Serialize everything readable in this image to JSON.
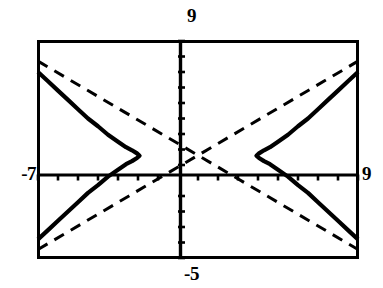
{
  "figure": {
    "name": "hyperbola-with-asymptotes-graph",
    "background_color": "#ffffff",
    "ink_color": "#000000"
  },
  "labels": {
    "ymax": "9",
    "ymin": "-5",
    "xmin": "-7",
    "xmax": "9"
  },
  "chart_data": {
    "type": "line",
    "title": "",
    "subtitle": "",
    "xlabel": "",
    "ylabel": "",
    "xlim": [
      -7,
      9
    ],
    "ylim": [
      -5,
      9
    ],
    "grid": false,
    "legend": "none",
    "axes": {
      "x_axis_at_y": 0,
      "y_axis_at_x": 0,
      "x_tick_interval": 1,
      "y_tick_interval": 1,
      "x_tick_labels_shown": [
        "-7",
        "9"
      ],
      "y_tick_labels_shown": [
        "9",
        "-5"
      ],
      "tick_length_px": 6,
      "frame": "rectangular window border"
    },
    "annotations": [
      "Window values: Xmin = -7, Xmax = 9, Ymin = -5, Ymax = 9",
      "Solid curve: horizontally opening hyperbola (two branches)",
      "Dashed lines: the two asymptotes of the hyperbola, crossing at the center"
    ],
    "hyperbola": {
      "center": [
        1,
        1.6
      ],
      "orientation": "horizontal",
      "a": 2.9,
      "b": 2.2,
      "left_vertex": [
        -1.9,
        1.6
      ],
      "right_vertex": [
        3.9,
        1.6
      ],
      "asymptote_slopes": [
        0.76,
        -0.76
      ]
    },
    "series": [
      {
        "name": "hyperbola-left-branch",
        "style": "solid",
        "points": [
          [
            -7.0,
            7.0
          ],
          [
            -6.5,
            6.4
          ],
          [
            -6.0,
            5.8
          ],
          [
            -5.5,
            5.2
          ],
          [
            -5.0,
            4.6
          ],
          [
            -4.5,
            4.0
          ],
          [
            -4.0,
            3.5
          ],
          [
            -3.5,
            2.95
          ],
          [
            -3.0,
            2.5
          ],
          [
            -2.6,
            2.15
          ],
          [
            -2.3,
            1.95
          ],
          [
            -2.05,
            1.75
          ],
          [
            -1.92,
            1.6
          ],
          [
            -2.05,
            1.45
          ],
          [
            -2.3,
            1.25
          ],
          [
            -2.6,
            1.05
          ],
          [
            -3.0,
            0.7
          ],
          [
            -3.5,
            0.25
          ],
          [
            -4.0,
            -0.3
          ],
          [
            -4.5,
            -0.8
          ],
          [
            -5.0,
            -1.4
          ],
          [
            -5.5,
            -2.0
          ],
          [
            -6.0,
            -2.6
          ],
          [
            -6.5,
            -3.2
          ],
          [
            -7.0,
            -3.8
          ]
        ]
      },
      {
        "name": "hyperbola-right-branch",
        "style": "solid",
        "points": [
          [
            9.0,
            7.0
          ],
          [
            8.5,
            6.4
          ],
          [
            8.0,
            5.8
          ],
          [
            7.5,
            5.2
          ],
          [
            7.0,
            4.6
          ],
          [
            6.5,
            4.0
          ],
          [
            6.0,
            3.5
          ],
          [
            5.5,
            2.95
          ],
          [
            5.0,
            2.5
          ],
          [
            4.6,
            2.15
          ],
          [
            4.3,
            1.95
          ],
          [
            4.05,
            1.75
          ],
          [
            3.92,
            1.6
          ],
          [
            4.05,
            1.45
          ],
          [
            4.3,
            1.25
          ],
          [
            4.6,
            1.05
          ],
          [
            5.0,
            0.7
          ],
          [
            5.5,
            0.25
          ],
          [
            6.0,
            -0.3
          ],
          [
            6.5,
            -0.8
          ],
          [
            7.0,
            -1.4
          ],
          [
            7.5,
            -2.0
          ],
          [
            8.0,
            -2.6
          ],
          [
            8.5,
            -3.2
          ],
          [
            9.0,
            -3.8
          ]
        ]
      },
      {
        "name": "asymptote-positive-slope",
        "style": "dashed",
        "points": [
          [
            -7.0,
            -4.45
          ],
          [
            9.0,
            7.7
          ]
        ]
      },
      {
        "name": "asymptote-negative-slope",
        "style": "dashed",
        "points": [
          [
            -7.0,
            7.7
          ],
          [
            9.0,
            -4.45
          ]
        ]
      }
    ]
  }
}
